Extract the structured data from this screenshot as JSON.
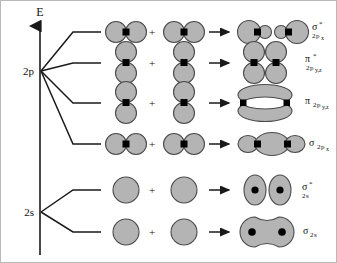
{
  "diagram": {
    "axis": {
      "energy_label": "E",
      "arrow_direction": "up"
    },
    "atomic_levels": [
      {
        "label": "2p",
        "n_branches": 4
      },
      {
        "label": "2s",
        "n_branches": 2
      }
    ],
    "operators": {
      "plus": "+",
      "arrow": "→"
    },
    "colors": {
      "orbital_fill": "#b4b4b4",
      "orbital_stroke": "#4a4a4a",
      "nucleus": "#000000",
      "line": "#1a1a1a",
      "background": "#ffffff",
      "frame": "#b9b9b9"
    },
    "rows": [
      {
        "id": "sigma-star-2px",
        "parent_level": "2p",
        "combination_type": "sigma-antibonding",
        "left_orbital": "p-orbital-horizontal",
        "right_orbital": "p-orbital-horizontal",
        "product_orbital": "sigma-antibonding-two-lobed-pairs",
        "label_main": "σ",
        "label_star": "*",
        "label_sub_n": "2",
        "label_sub_orbital": "p",
        "label_sub_axis": "x",
        "label_text": "σ*2px"
      },
      {
        "id": "pi-star-2pyz",
        "parent_level": "2p",
        "combination_type": "pi-antibonding",
        "left_orbital": "p-orbital-vertical",
        "right_orbital": "p-orbital-vertical",
        "product_orbital": "pi-antibonding-two-vertical-dumbbells",
        "label_main": "π",
        "label_star": "*",
        "label_sub_n": "2",
        "label_sub_orbital": "p",
        "label_sub_axis": "y,z",
        "label_text": "π*2py,z"
      },
      {
        "id": "pi-2pyz",
        "parent_level": "2p",
        "combination_type": "pi-bonding",
        "left_orbital": "p-orbital-vertical",
        "right_orbital": "p-orbital-vertical",
        "product_orbital": "pi-bonding-merged-ellipse-pair",
        "label_main": "π",
        "label_star": "",
        "label_sub_n": "2",
        "label_sub_orbital": "p",
        "label_sub_axis": "y,z",
        "label_text": "π2py,z"
      },
      {
        "id": "sigma-2px",
        "parent_level": "2p",
        "combination_type": "sigma-bonding",
        "left_orbital": "p-orbital-horizontal",
        "right_orbital": "p-orbital-horizontal",
        "product_orbital": "sigma-bonding-three-lobe-chain",
        "label_main": "σ",
        "label_star": "",
        "label_sub_n": "2",
        "label_sub_orbital": "p",
        "label_sub_axis": "x",
        "label_text": "σ2px"
      },
      {
        "id": "sigma-star-2s",
        "parent_level": "2s",
        "combination_type": "sigma-antibonding",
        "left_orbital": "s-orbital-circle",
        "right_orbital": "s-orbital-circle",
        "product_orbital": "sigma-antibonding-two-separated-ovals",
        "label_main": "σ",
        "label_star": "*",
        "label_sub_n": "2",
        "label_sub_orbital": "s",
        "label_sub_axis": "",
        "label_text": "σ*2s"
      },
      {
        "id": "sigma-2s",
        "parent_level": "2s",
        "combination_type": "sigma-bonding",
        "left_orbital": "s-orbital-circle",
        "right_orbital": "s-orbital-circle",
        "product_orbital": "sigma-bonding-merged-peanut",
        "label_main": "σ",
        "label_star": "",
        "label_sub_n": "2",
        "label_sub_orbital": "s",
        "label_sub_axis": "",
        "label_text": "σ2s"
      }
    ]
  }
}
